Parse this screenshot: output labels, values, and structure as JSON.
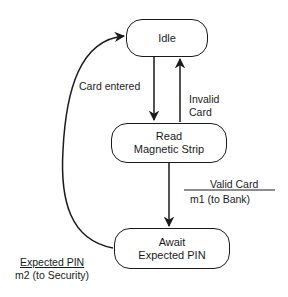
{
  "diagram": {
    "type": "state-transition",
    "states": [
      {
        "id": "idle",
        "lines": [
          "Idle"
        ]
      },
      {
        "id": "read",
        "lines": [
          "Read",
          "Magnetic Strip"
        ]
      },
      {
        "id": "await",
        "lines": [
          "Await",
          "Expected PIN"
        ]
      }
    ],
    "transitions": [
      {
        "from": "idle",
        "to": "read",
        "event": "Card entered"
      },
      {
        "from": "read",
        "to": "idle",
        "event_lines": [
          "Invalid",
          "Card"
        ]
      },
      {
        "from": "read",
        "to": "await",
        "event": "Valid Card",
        "action": "m1 (to Bank)"
      },
      {
        "from": "await",
        "to": "idle",
        "event": "Expected PIN",
        "action": "m2 (to Security)"
      }
    ]
  }
}
